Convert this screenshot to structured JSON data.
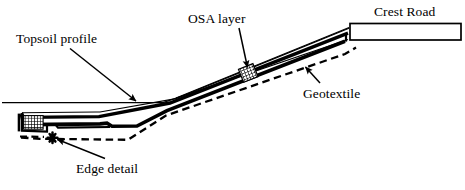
{
  "figure": {
    "type": "engineering-cross-section-diagram",
    "background_color": "#ffffff",
    "line_color": "#000000",
    "width": 465,
    "height": 190
  },
  "labels": {
    "topsoil": "Topsoil profile",
    "osa_layer": "OSA layer",
    "crest_road": "Crest Road",
    "geotextile": "Geotextile",
    "edge_detail": "Edge detail"
  },
  "components": {
    "topsoil_line_name": "topsoil-profile-line",
    "osa_band_name": "osa-layer-band",
    "geotextile_line_name": "geotextile-dashed-line",
    "crest_road_name": "crest-road-box",
    "edge_detail_name": "edge-detail-toe",
    "osa_hatch_marker_name": "osa-hatch-marker",
    "toe_hatch_marker_name": "toe-hatch-marker",
    "edge_star_marker_name": "edge-detail-star-marker"
  },
  "leaders": [
    {
      "name": "topsoil-leader",
      "from_label": "Topsoil profile",
      "points_to": "topsoil-profile-line"
    },
    {
      "name": "osa-leader",
      "from_label": "OSA layer",
      "points_to": "osa-hatch-marker"
    },
    {
      "name": "geotextile-leader",
      "from_label": "Geotextile",
      "points_to": "geotextile-dashed-line"
    },
    {
      "name": "edge-detail-leader",
      "from_label": "Edge detail",
      "points_to": "edge-detail-star-marker"
    }
  ]
}
